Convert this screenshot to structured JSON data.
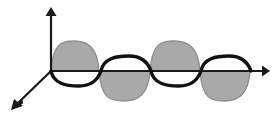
{
  "figure": {
    "title": "Electromagnetic wave propagating along the horizontal axis",
    "kind": "3d-wave-diagram",
    "canvas": {
      "width": 275,
      "height": 117,
      "background": "#ffffff"
    }
  },
  "colors": {
    "axis": "#1a1a1a",
    "gray_wave_fill": "#a9a9a9",
    "gray_wave_stroke": "#8e8e8e",
    "black_wave_stroke": "#111111"
  },
  "axes": {
    "origin": {
      "x": 51,
      "y": 71
    },
    "vertical": {
      "name": "y-axis",
      "from": {
        "x": 51,
        "y": 71
      },
      "to": {
        "x": 51,
        "y": 10
      },
      "arrow": "up",
      "label": ""
    },
    "horizontal": {
      "name": "x-axis",
      "from": {
        "x": 51,
        "y": 71
      },
      "to": {
        "x": 266,
        "y": 71
      },
      "arrow": "right",
      "label": ""
    },
    "diagonal": {
      "name": "z-axis",
      "from": {
        "x": 51,
        "y": 71
      },
      "to": {
        "x": 13,
        "y": 108
      },
      "arrow": "down-left",
      "label": ""
    }
  },
  "chart_data": {
    "type": "line",
    "title": "Electromagnetic wave propagating along the horizontal axis",
    "xlabel": "",
    "ylabel": "",
    "grid": false,
    "legend": "none",
    "xlim": [
      51,
      268
    ],
    "ylim": [
      -32,
      32
    ],
    "baseline_y": 71,
    "series": [
      {
        "name": "gray-shaded-wave",
        "style": "filled-lobes",
        "color": "#a9a9a9",
        "amplitude": 30,
        "periods": 2,
        "x_start": 51,
        "x_end": 250,
        "zero_crossings": [
          51,
          99,
          150,
          200,
          250
        ],
        "lobe_signs": [
          "up",
          "down",
          "up",
          "down"
        ],
        "peaks": [
          {
            "x": 75,
            "y": 41
          },
          {
            "x": 125,
            "y": 101
          },
          {
            "x": 175,
            "y": 41
          },
          {
            "x": 225,
            "y": 101
          }
        ]
      },
      {
        "name": "black-curve-wave",
        "style": "open-curve",
        "color": "#111111",
        "amplitude": 15,
        "periods": 2,
        "x_start": 51,
        "x_end": 252,
        "zero_crossings": [
          51,
          101,
          151,
          201,
          251
        ],
        "lobe_signs": [
          "down",
          "up",
          "down",
          "up"
        ],
        "peaks": [
          {
            "x": 76,
            "y": 86
          },
          {
            "x": 128,
            "y": 56
          },
          {
            "x": 176,
            "y": 86
          },
          {
            "x": 228,
            "y": 56
          }
        ]
      }
    ]
  }
}
